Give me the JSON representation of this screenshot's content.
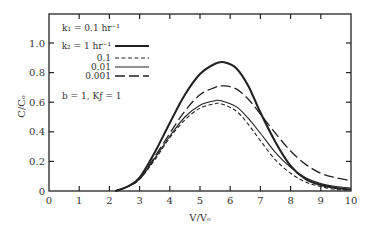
{
  "chart_data": {
    "type": "line",
    "title": "",
    "xlabel": "V/Vₒ",
    "ylabel": "C/Cₒ",
    "xlim": [
      0,
      10
    ],
    "ylim": [
      0,
      1.2
    ],
    "xticks": [
      0,
      1,
      2,
      3,
      4,
      5,
      6,
      7,
      8,
      9,
      10
    ],
    "yticks": [
      0,
      0.2,
      0.4,
      0.6,
      0.8,
      1.0
    ],
    "ytick_labels": [
      "0",
      "0.2",
      "0.4",
      "0.6",
      "0.8",
      "1.0"
    ],
    "grid": false,
    "annotations": [
      "k₁ = 0.1 hr⁻¹",
      "b = 1, Kƒ = 1"
    ],
    "legend_title": "k₂ = 1 hr⁻¹",
    "legend_position": "upper left",
    "series": [
      {
        "name": "1 hr⁻¹",
        "style": "solid-thick",
        "x": [
          2.2,
          2.6,
          3.0,
          3.5,
          4.0,
          4.5,
          5.0,
          5.5,
          5.8,
          6.2,
          6.6,
          7.0,
          7.5,
          8.0,
          8.5,
          9.0,
          9.5,
          10.0
        ],
        "y": [
          0.0,
          0.03,
          0.09,
          0.26,
          0.46,
          0.65,
          0.79,
          0.86,
          0.87,
          0.83,
          0.71,
          0.53,
          0.33,
          0.17,
          0.08,
          0.04,
          0.02,
          0.01
        ]
      },
      {
        "name": "0.1",
        "style": "short-dash",
        "x": [
          2.2,
          2.6,
          3.0,
          3.5,
          4.0,
          4.5,
          5.0,
          5.5,
          5.7,
          6.2,
          6.6,
          7.0,
          7.5,
          8.0,
          8.5,
          9.0,
          9.5,
          10.0
        ],
        "y": [
          0.0,
          0.03,
          0.08,
          0.21,
          0.36,
          0.48,
          0.56,
          0.59,
          0.59,
          0.54,
          0.45,
          0.34,
          0.21,
          0.12,
          0.06,
          0.03,
          0.01,
          0.005
        ]
      },
      {
        "name": "0.01",
        "style": "solid-thin",
        "x": [
          2.2,
          2.6,
          3.0,
          3.5,
          4.0,
          4.5,
          5.0,
          5.5,
          5.7,
          6.2,
          6.6,
          7.0,
          7.5,
          8.0,
          8.5,
          9.0,
          9.5,
          10.0
        ],
        "y": [
          0.0,
          0.03,
          0.08,
          0.22,
          0.37,
          0.5,
          0.58,
          0.61,
          0.61,
          0.57,
          0.49,
          0.39,
          0.26,
          0.16,
          0.09,
          0.05,
          0.03,
          0.02
        ]
      },
      {
        "name": "0.001",
        "style": "long-dash",
        "x": [
          2.2,
          2.6,
          3.0,
          3.5,
          4.0,
          4.5,
          5.0,
          5.5,
          5.8,
          6.2,
          6.6,
          7.0,
          7.5,
          8.0,
          8.5,
          9.0,
          9.5,
          10.0
        ],
        "y": [
          0.0,
          0.03,
          0.08,
          0.23,
          0.39,
          0.54,
          0.65,
          0.7,
          0.71,
          0.69,
          0.62,
          0.52,
          0.39,
          0.27,
          0.18,
          0.12,
          0.09,
          0.07
        ]
      }
    ]
  }
}
